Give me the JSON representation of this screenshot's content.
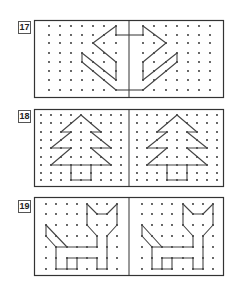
{
  "exercises": [
    {
      "number": "17",
      "top": 20,
      "label_top": 21,
      "height": 78,
      "frame": {
        "width": 190
      },
      "divider_x": 95,
      "grid": {
        "left_cols_x": [
          15,
          26,
          37,
          48,
          59,
          70,
          82
        ],
        "right_cols_x": [
          109,
          120,
          132,
          143,
          154,
          165,
          176
        ],
        "rows_y": [
          6,
          15,
          23,
          33,
          42,
          51,
          60,
          70
        ]
      },
      "shape": {
        "description": "arrow-like symmetric figure",
        "left_segments": [
          [
            [
              6,
              1
            ],
            [
              6,
              0
            ]
          ],
          [
            [
              6,
              0
            ],
            [
              4,
              2
            ]
          ],
          [
            [
              4,
              2
            ],
            [
              6,
              4
            ]
          ],
          [
            [
              6,
              4
            ],
            [
              6,
              6
            ]
          ],
          [
            [
              6,
              6
            ],
            [
              3,
              3
            ]
          ],
          [
            [
              3,
              3
            ],
            [
              3,
              4
            ]
          ],
          [
            [
              3,
              4
            ],
            [
              6,
              7
            ]
          ]
        ],
        "right_segments": [
          [
            [
              0,
              1
            ],
            [
              0,
              0
            ]
          ],
          [
            [
              0,
              0
            ],
            [
              2,
              2
            ]
          ],
          [
            [
              2,
              2
            ],
            [
              0,
              4
            ]
          ],
          [
            [
              0,
              4
            ],
            [
              0,
              6
            ]
          ],
          [
            [
              0,
              6
            ],
            [
              3,
              3
            ]
          ],
          [
            [
              3,
              3
            ],
            [
              3,
              4
            ]
          ],
          [
            [
              3,
              4
            ],
            [
              0,
              7
            ]
          ]
        ],
        "bridge_rows": [
          1,
          7
        ]
      }
    },
    {
      "number": "18",
      "top": 109,
      "label_top": 110,
      "height": 78,
      "frame": {
        "width": 190
      },
      "divider_x": 95,
      "grid": {
        "left_cols_x": [
          7,
          17,
          27,
          37,
          47,
          57,
          67,
          77,
          87
        ],
        "right_cols_x": [
          103,
          113,
          123,
          133,
          143,
          153,
          163,
          173,
          183
        ],
        "rows_y": [
          6,
          14,
          23,
          31,
          39,
          48,
          56,
          64,
          71
        ]
      },
      "shape": {
        "description": "fir tree",
        "left_segments": [
          [
            [
              4,
              0
            ],
            [
              2,
              2
            ]
          ],
          [
            [
              2,
              2
            ],
            [
              3,
              2
            ]
          ],
          [
            [
              3,
              2
            ],
            [
              1,
              4
            ]
          ],
          [
            [
              1,
              4
            ],
            [
              3,
              4
            ]
          ],
          [
            [
              3,
              4
            ],
            [
              1,
              6
            ]
          ],
          [
            [
              4,
              0
            ],
            [
              6,
              2
            ]
          ],
          [
            [
              6,
              2
            ],
            [
              5,
              2
            ]
          ],
          [
            [
              5,
              2
            ],
            [
              7,
              4
            ]
          ],
          [
            [
              7,
              4
            ],
            [
              5,
              4
            ]
          ],
          [
            [
              5,
              4
            ],
            [
              7,
              6
            ]
          ],
          [
            [
              1,
              6
            ],
            [
              7,
              6
            ]
          ],
          [
            [
              3,
              6
            ],
            [
              3,
              8
            ]
          ],
          [
            [
              3,
              8
            ],
            [
              5,
              8
            ]
          ],
          [
            [
              5,
              8
            ],
            [
              5,
              6
            ]
          ]
        ],
        "right_segments": [
          [
            [
              4,
              0
            ],
            [
              2,
              2
            ]
          ],
          [
            [
              2,
              2
            ],
            [
              3,
              2
            ]
          ],
          [
            [
              3,
              2
            ],
            [
              1,
              4
            ]
          ],
          [
            [
              1,
              4
            ],
            [
              3,
              4
            ]
          ],
          [
            [
              3,
              4
            ],
            [
              1,
              6
            ]
          ],
          [
            [
              4,
              0
            ],
            [
              6,
              2
            ]
          ],
          [
            [
              6,
              2
            ],
            [
              5,
              2
            ]
          ],
          [
            [
              5,
              2
            ],
            [
              7,
              4
            ]
          ],
          [
            [
              7,
              4
            ],
            [
              5,
              4
            ]
          ],
          [
            [
              5,
              4
            ],
            [
              7,
              6
            ]
          ],
          [
            [
              1,
              6
            ],
            [
              7,
              6
            ]
          ],
          [
            [
              3,
              6
            ],
            [
              3,
              8
            ]
          ],
          [
            [
              3,
              8
            ],
            [
              5,
              8
            ]
          ],
          [
            [
              5,
              8
            ],
            [
              5,
              6
            ]
          ]
        ],
        "bridge_rows": []
      }
    },
    {
      "number": "19",
      "top": 197,
      "label_top": 200,
      "height": 79,
      "frame": {
        "width": 190
      },
      "divider_x": 95,
      "grid": {
        "left_cols_x": [
          12,
          22,
          33,
          43,
          53,
          63,
          73,
          83
        ],
        "right_cols_x": [
          108,
          118,
          128,
          138,
          149,
          159,
          169,
          179
        ],
        "rows_y": [
          7,
          17,
          28,
          39,
          50,
          61,
          72
        ]
      },
      "shape": {
        "description": "cat",
        "left_segments": [
          [
            [
              4,
              0
            ],
            [
              5,
              1
            ]
          ],
          [
            [
              5,
              1
            ],
            [
              6,
              1
            ]
          ],
          [
            [
              6,
              1
            ],
            [
              7,
              0
            ]
          ],
          [
            [
              7,
              0
            ],
            [
              7,
              2
            ]
          ],
          [
            [
              7,
              2
            ],
            [
              6,
              3
            ]
          ],
          [
            [
              4,
              0
            ],
            [
              4,
              2
            ]
          ],
          [
            [
              4,
              2
            ],
            [
              5,
              3
            ]
          ],
          [
            [
              5,
              3
            ],
            [
              5,
              4
            ]
          ],
          [
            [
              6,
              3
            ],
            [
              6,
              6
            ]
          ],
          [
            [
              5,
              4
            ],
            [
              1,
              4
            ]
          ],
          [
            [
              0,
              2
            ],
            [
              0,
              3
            ]
          ],
          [
            [
              0,
              3
            ],
            [
              1,
              4
            ]
          ],
          [
            [
              0,
              2
            ],
            [
              2,
              4
            ]
          ],
          [
            [
              1,
              4
            ],
            [
              1,
              6
            ]
          ],
          [
            [
              1,
              6
            ],
            [
              3,
              6
            ]
          ],
          [
            [
              2,
              5
            ],
            [
              2,
              6
            ]
          ],
          [
            [
              3,
              5
            ],
            [
              3,
              6
            ]
          ],
          [
            [
              2,
              5
            ],
            [
              5,
              5
            ]
          ],
          [
            [
              5,
              5
            ],
            [
              5,
              6
            ]
          ],
          [
            [
              5,
              6
            ],
            [
              6,
              6
            ]
          ]
        ],
        "right_segments": [
          [
            [
              4,
              0
            ],
            [
              5,
              1
            ]
          ],
          [
            [
              5,
              1
            ],
            [
              6,
              1
            ]
          ],
          [
            [
              6,
              1
            ],
            [
              7,
              0
            ]
          ],
          [
            [
              7,
              0
            ],
            [
              7,
              2
            ]
          ],
          [
            [
              7,
              2
            ],
            [
              6,
              3
            ]
          ],
          [
            [
              4,
              0
            ],
            [
              4,
              2
            ]
          ],
          [
            [
              4,
              2
            ],
            [
              5,
              3
            ]
          ],
          [
            [
              5,
              3
            ],
            [
              5,
              4
            ]
          ],
          [
            [
              6,
              3
            ],
            [
              6,
              6
            ]
          ],
          [
            [
              5,
              4
            ],
            [
              1,
              4
            ]
          ],
          [
            [
              0,
              2
            ],
            [
              0,
              3
            ]
          ],
          [
            [
              0,
              3
            ],
            [
              1,
              4
            ]
          ],
          [
            [
              0,
              2
            ],
            [
              2,
              4
            ]
          ],
          [
            [
              1,
              4
            ],
            [
              1,
              6
            ]
          ],
          [
            [
              1,
              6
            ],
            [
              3,
              6
            ]
          ],
          [
            [
              2,
              5
            ],
            [
              2,
              6
            ]
          ],
          [
            [
              3,
              5
            ],
            [
              3,
              6
            ]
          ],
          [
            [
              2,
              5
            ],
            [
              5,
              5
            ]
          ],
          [
            [
              5,
              5
            ],
            [
              5,
              6
            ]
          ],
          [
            [
              5,
              6
            ],
            [
              6,
              6
            ]
          ]
        ],
        "bridge_rows": []
      }
    }
  ],
  "colors": {
    "frame": "#333333",
    "line": "#444444",
    "dot": "#222222",
    "label_border": "#555555"
  }
}
